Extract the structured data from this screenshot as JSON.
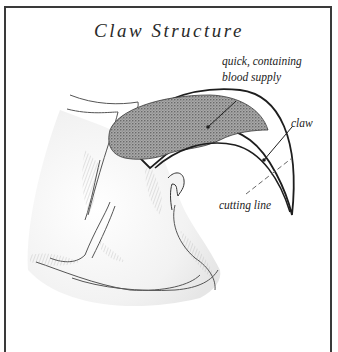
{
  "title": "Claw Structure",
  "labels": {
    "quick_line1": "quick, containing",
    "quick_line2": "blood supply",
    "claw": "claw",
    "cutting_line": "cutting line"
  },
  "colors": {
    "frame": "#3a3a3a",
    "ink": "#222222",
    "quick_fill": "#8a8a8a",
    "shading": "#b8b8b8"
  }
}
